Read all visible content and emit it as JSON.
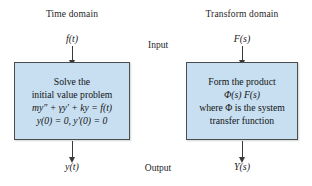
{
  "diagram": {
    "title_left": "Time domain",
    "title_right": "Transform domain",
    "input_label": "Input",
    "output_label": "Output",
    "input_symbol_left": "f(t)",
    "input_symbol_right": "F(s)",
    "output_symbol_left": "y(t)",
    "output_symbol_right": "Y(s)",
    "box_left": {
      "lines": [
        "Solve the",
        "initial value problem",
        "my″ + γy′ + ky = f(t)",
        "y(0) = 0, y′(0) = 0"
      ]
    },
    "box_right": {
      "lines": [
        "Form the product",
        "Φ(s) F(s)",
        "where Φ is the system",
        "transfer function"
      ]
    },
    "colors": {
      "box_fill": "#c7dff1",
      "box_border": "#4c4c4c",
      "arrow": "#3a3a3a",
      "text": "#1b1b1b",
      "background": "#ffffff"
    },
    "arrows": [
      {
        "name": "input-arrow-time",
        "direction": "down"
      },
      {
        "name": "input-arrow-transform",
        "direction": "down"
      },
      {
        "name": "output-arrow-time",
        "direction": "down"
      },
      {
        "name": "output-arrow-transform",
        "direction": "down"
      }
    ]
  }
}
